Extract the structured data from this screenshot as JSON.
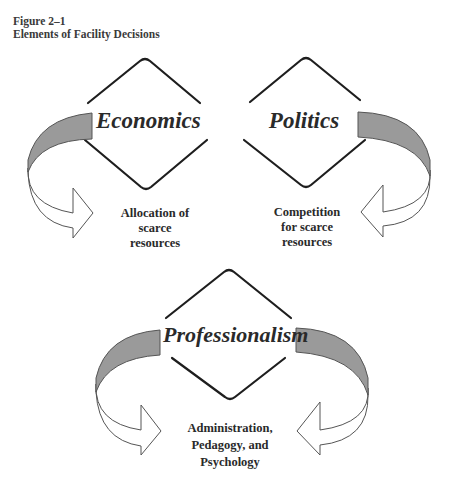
{
  "figure": {
    "number": "Figure 2–1",
    "title": "Elements of Facility Decisions"
  },
  "elements": [
    {
      "name": "Economics",
      "description_lines": [
        "Allocation of",
        "scarce",
        "resources"
      ]
    },
    {
      "name": "Politics",
      "description_lines": [
        "Competition",
        "for scarce",
        "resources"
      ]
    },
    {
      "name": "Professionalism",
      "description_lines": [
        "Administration,",
        "Pedagogy, and",
        "Psychology"
      ]
    }
  ],
  "colors": {
    "diamond_stroke": "#1e1e1e",
    "band_fill": "#9a9a9a",
    "arrow_fill": "#ffffff",
    "arrow_stroke": "#555555",
    "text": "#2a2a2a"
  },
  "icons": {
    "curved_arrow": "curved-arrow-icon"
  }
}
